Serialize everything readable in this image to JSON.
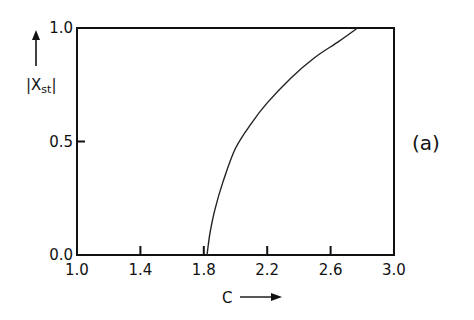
{
  "chart_data": {
    "type": "line",
    "title": "",
    "panel_label": "(a)",
    "xlabel": "C",
    "ylabel": "|X_st|",
    "ylabel_main": "|X",
    "ylabel_sub": "st",
    "ylabel_end": "|",
    "xlim": [
      1.0,
      3.0
    ],
    "ylim": [
      0.0,
      1.0
    ],
    "grid": false,
    "legend": null,
    "x_ticks": [
      "1.0",
      "1.4",
      "1.8",
      "2.2",
      "2.6",
      "3.0"
    ],
    "y_ticks": [
      "0.0",
      "0.5",
      "1.0"
    ],
    "series": [
      {
        "name": "|X_st| vs C",
        "x": [
          1.82,
          1.84,
          1.87,
          1.92,
          2.0,
          2.1,
          2.2,
          2.35,
          2.5,
          2.65,
          2.77
        ],
        "y": [
          0.0,
          0.1,
          0.2,
          0.32,
          0.47,
          0.58,
          0.67,
          0.78,
          0.87,
          0.94,
          1.0
        ]
      }
    ]
  }
}
